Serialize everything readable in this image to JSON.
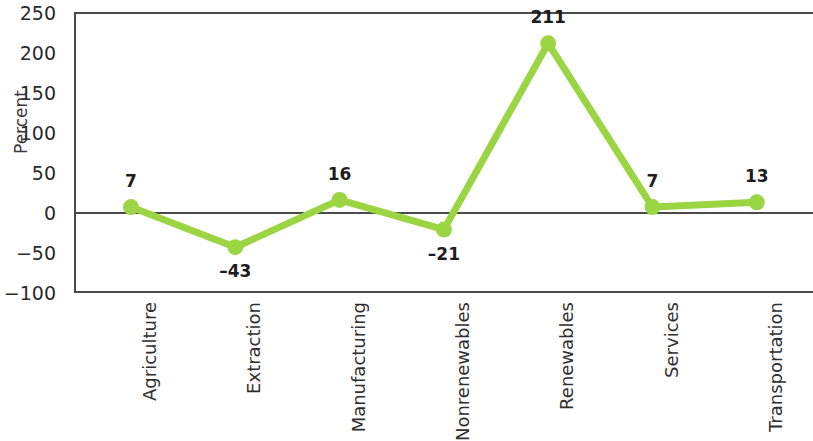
{
  "chart_data": {
    "type": "line",
    "title": "",
    "subtitle": "",
    "xlabel": "",
    "ylabel": "Percent",
    "categories": [
      "Agriculture",
      "Extraction",
      "Manufacturing",
      "Nonrenewables",
      "Renewables",
      "Services",
      "Transportation"
    ],
    "values": [
      7,
      -43,
      16,
      -21,
      211,
      7,
      13
    ],
    "data_labels": [
      "7",
      "–43",
      "16",
      "–21",
      "211",
      "7",
      "13"
    ],
    "ylim": [
      -100,
      250
    ],
    "yticks": [
      250,
      200,
      150,
      100,
      50,
      0,
      -50,
      -100
    ],
    "ytick_labels": [
      "250",
      "200",
      "150",
      "100",
      "50",
      "0",
      "−50",
      "−100"
    ],
    "grid": false,
    "legend": "none",
    "zero_line": true,
    "series_color": "#9bd544",
    "marker": "circle",
    "axis_color": "#4a4a4a",
    "text_color": "#2b2b2b"
  },
  "axis": {
    "ylabel": "Percent"
  }
}
